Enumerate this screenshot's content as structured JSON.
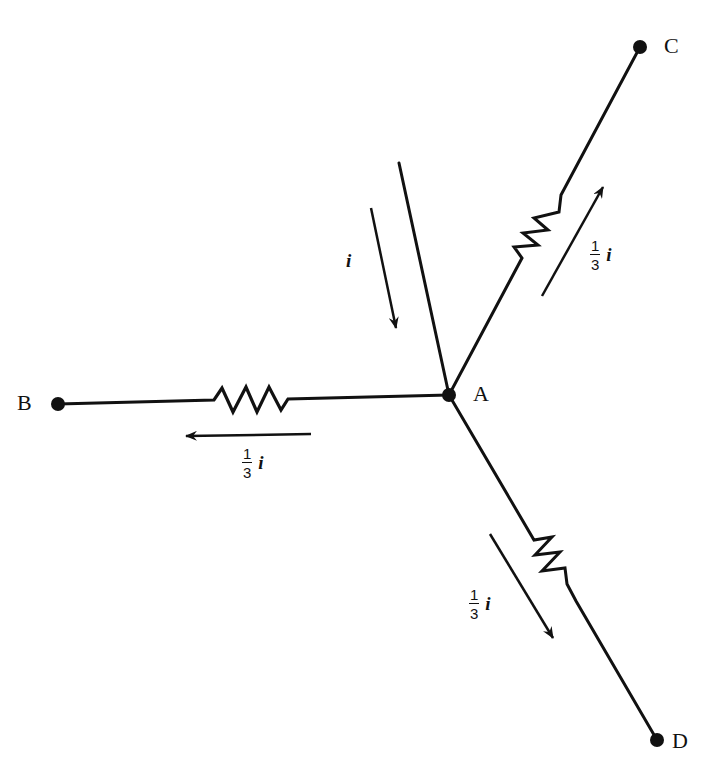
{
  "diagram": {
    "type": "circuit-junction",
    "colors": {
      "ink": "#111111",
      "background": "#ffffff"
    },
    "nodes": {
      "A": {
        "label": "A",
        "x": 449,
        "y": 395
      },
      "B": {
        "label": "B",
        "x": 58,
        "y": 404
      },
      "C": {
        "label": "C",
        "x": 640,
        "y": 47
      },
      "D": {
        "label": "D",
        "x": 657,
        "y": 740
      }
    },
    "input_wire": {
      "from": [
        399,
        163
      ],
      "to": [
        449,
        395
      ]
    },
    "branches": [
      {
        "id": "AB",
        "to": "B",
        "current_label": {
          "numerator": "1",
          "denominator": "3",
          "variable": "i"
        }
      },
      {
        "id": "AC",
        "to": "C",
        "current_label": {
          "numerator": "1",
          "denominator": "3",
          "variable": "i"
        }
      },
      {
        "id": "AD",
        "to": "D",
        "current_label": {
          "numerator": "1",
          "denominator": "3",
          "variable": "i"
        }
      }
    ],
    "input_current": {
      "label": "i"
    }
  }
}
